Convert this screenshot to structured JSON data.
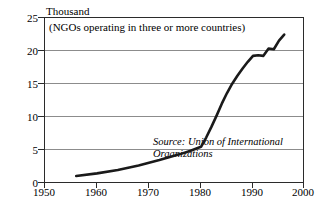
{
  "chart_data": {
    "type": "line",
    "title": "",
    "subtitle": "(NGOs operating in three or more countries)",
    "unit_label": "Thousand",
    "source_note": "Source: Union of International Organizations",
    "xlabel": "",
    "ylabel": "",
    "xlim": [
      1950,
      2000
    ],
    "ylim": [
      0,
      25
    ],
    "grid": true,
    "legend": "none",
    "x_ticks": [
      1950,
      1960,
      1970,
      1980,
      1990,
      2000
    ],
    "y_ticks": [
      0,
      5,
      10,
      15,
      20,
      25
    ],
    "series": [
      {
        "name": "International NGOs",
        "x": [
          1956,
          1960,
          1964,
          1968,
          1972,
          1976,
          1978,
          1980,
          1981,
          1982,
          1983,
          1984,
          1985,
          1986,
          1987,
          1988,
          1989,
          1990,
          1991,
          1992,
          1993,
          1994,
          1995,
          1996
        ],
        "values": [
          1.2,
          1.6,
          2.1,
          2.8,
          3.6,
          4.5,
          5.0,
          5.6,
          7.0,
          8.6,
          10.3,
          12.1,
          13.7,
          15.1,
          16.3,
          17.4,
          18.4,
          19.3,
          19.4,
          19.3,
          20.4,
          20.3,
          21.6,
          22.5
        ]
      }
    ]
  },
  "axes": {
    "y_tick_labels": [
      "0",
      "5",
      "10",
      "15",
      "20",
      "25"
    ],
    "x_tick_labels": [
      "1950",
      "1960",
      "1970",
      "1980",
      "1990",
      "2000"
    ]
  }
}
